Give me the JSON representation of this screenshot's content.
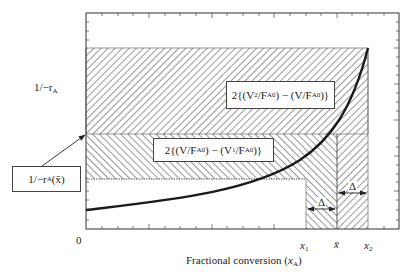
{
  "diagram": {
    "type": "levenspiel-plot",
    "y_axis_label": "1/−r",
    "y_axis_label_sub": "A",
    "x_axis_label": "Fractional conversion (",
    "x_axis_label_var": "x",
    "x_axis_label_sub": "A",
    "x_axis_label_close": ")",
    "origin_label": "0",
    "x_ticks": [
      {
        "name": "x1",
        "text": "x",
        "sub": "1"
      },
      {
        "name": "xbar",
        "text": "x̄",
        "sub": ""
      },
      {
        "name": "x2",
        "text": "x",
        "sub": "2"
      }
    ],
    "callout_box": {
      "text": "1/−r",
      "sub": "A",
      "suffix": "(x̄)"
    },
    "upper_region_label": {
      "prefix": "2{(V",
      "sub1": "2",
      "mid1": "/F",
      "sub2": "A0",
      "mid2": ") − (V/F",
      "sub3": "A0",
      "suffix": ")}"
    },
    "lower_region_label": {
      "prefix": "2{(V/F",
      "sub1": "A0",
      "mid1": ") − (V",
      "sub2": "1",
      "mid2": "/F",
      "sub3": "A0",
      "suffix": ")}"
    },
    "delta_labels": [
      "Δ",
      "Δ"
    ],
    "colors": {
      "line": "#222222",
      "hatch": "#444444",
      "background": "#ffffff"
    }
  }
}
